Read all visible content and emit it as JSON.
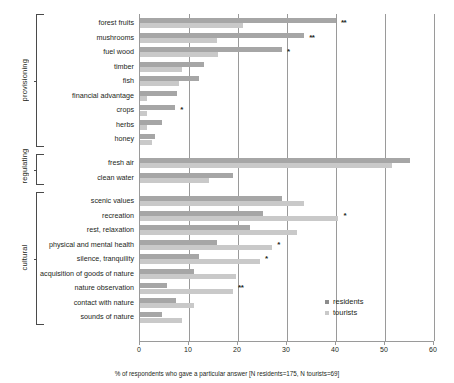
{
  "chart_data": {
    "type": "bar",
    "orientation": "horizontal",
    "title": "",
    "xlabel": "% of respondents who gave a particular answer [N residents=175, N tourists=69]",
    "ylabel": "",
    "xlim": [
      0,
      60
    ],
    "xticks": [
      0,
      10,
      20,
      30,
      40,
      50,
      60
    ],
    "grid": true,
    "legend_position": "right-inside",
    "categories": [
      "forest fruits",
      "mushrooms",
      "fuel wood",
      "timber",
      "fish",
      "financial advantage",
      "crops",
      "herbs",
      "honey",
      "fresh air",
      "clean water",
      "scenic values",
      "recreation",
      "rest, relaxation",
      "physical and mental health",
      "silence, tranquility",
      "acquisition of goods of nature",
      "nature observation",
      "contact with nature",
      "sounds of nature"
    ],
    "series": [
      {
        "name": "residents",
        "color": "#a6a6a6",
        "values": [
          40.0,
          33.5,
          29.0,
          13.0,
          12.0,
          7.5,
          7.2,
          4.5,
          3.0,
          55.0,
          19.0,
          29.0,
          25.0,
          22.5,
          15.7,
          12.0,
          11.0,
          5.5,
          7.3,
          4.5
        ]
      },
      {
        "name": "tourists",
        "color": "#c9c9c9",
        "values": [
          21.0,
          15.7,
          16.0,
          8.5,
          8.0,
          1.5,
          1.5,
          1.5,
          2.5,
          51.5,
          14.0,
          33.5,
          40.5,
          32.0,
          27.0,
          24.5,
          19.5,
          19.0,
          11.0,
          8.5
        ]
      }
    ],
    "significance": {
      "forest fruits": "**",
      "mushrooms": "**",
      "fuel wood": "*",
      "crops": "*",
      "recreation": "*",
      "physical and mental health": "*",
      "silence, tranquility": "*",
      "nature observation": "**"
    },
    "groups": [
      {
        "label": "provisioning",
        "from": "forest fruits",
        "to": "honey"
      },
      {
        "label": "regulating",
        "from": "fresh air",
        "to": "clean water"
      },
      {
        "label": "cultural",
        "from": "scenic values",
        "to": "sounds of nature"
      }
    ]
  },
  "legend": {
    "items": [
      {
        "label": "residents",
        "swatch": "residents"
      },
      {
        "label": "tourists",
        "swatch": "tourists"
      }
    ]
  },
  "caption": "% of respondents who gave a particular answer [N residents=175, N tourists=69]"
}
